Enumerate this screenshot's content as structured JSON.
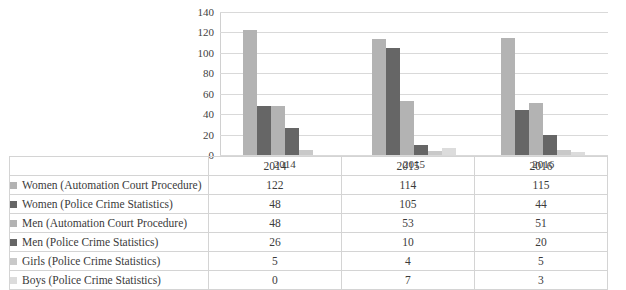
{
  "chart_data": {
    "type": "bar",
    "title": "",
    "xlabel": "",
    "ylabel": "",
    "categories": [
      "2014",
      "2015",
      "2016"
    ],
    "ylim": [
      0,
      140
    ],
    "ytick_labels": [
      "140",
      "120",
      "100",
      "80",
      "60",
      "40",
      "20",
      "0"
    ],
    "ytick_values": [
      140,
      120,
      100,
      80,
      60,
      40,
      20,
      0
    ],
    "grid": true,
    "legend_position": "data-table-below",
    "series": [
      {
        "name": "Women (Automation Court Procedure)",
        "color": "#b3b3b3",
        "values": [
          122,
          114,
          115
        ]
      },
      {
        "name": "Women (Police Crime Statistics)",
        "color": "#666666",
        "values": [
          48,
          105,
          44
        ]
      },
      {
        "name": "Men (Automation Court Procedure)",
        "color": "#b3b3b3",
        "values": [
          48,
          53,
          51
        ]
      },
      {
        "name": "Men (Police Crime Statistics)",
        "color": "#666666",
        "values": [
          26,
          10,
          20
        ]
      },
      {
        "name": "Girls (Police Crime Statistics)",
        "color": "#c9c9c9",
        "values": [
          5,
          4,
          5
        ]
      },
      {
        "name": "Boys (Police Crime Statistics)",
        "color": "#dcdcdc",
        "values": [
          0,
          7,
          3
        ]
      }
    ]
  },
  "table": {
    "corner_label": "",
    "column_headers": [
      "2014",
      "2015",
      "2016"
    ],
    "rows": [
      {
        "label": "Women (Automation Court Procedure)",
        "swatch": "#b3b3b3",
        "values": [
          "122",
          "114",
          "115"
        ]
      },
      {
        "label": "Women (Police Crime Statistics)",
        "swatch": "#666666",
        "values": [
          "48",
          "105",
          "44"
        ]
      },
      {
        "label": "Men (Automation Court Procedure)",
        "swatch": "#b3b3b3",
        "values": [
          "48",
          "53",
          "51"
        ]
      },
      {
        "label": "Men (Police Crime Statistics)",
        "swatch": "#666666",
        "values": [
          "26",
          "10",
          "20"
        ]
      },
      {
        "label": "Girls (Police Crime Statistics)",
        "swatch": "#c9c9c9",
        "values": [
          "5",
          "4",
          "5"
        ]
      },
      {
        "label": "Boys (Police Crime Statistics)",
        "swatch": "#dcdcdc",
        "values": [
          "0",
          "7",
          "3"
        ]
      }
    ]
  },
  "colors": {
    "background": "#ffffff",
    "gridline": "#d9d9d9",
    "table_border": "#d4d4d4",
    "text": "#3b3b3b",
    "light_gray_series": "#b3b3b3",
    "dark_gray_series": "#666666",
    "girls_series": "#c9c9c9",
    "boys_series": "#dcdcdc"
  }
}
